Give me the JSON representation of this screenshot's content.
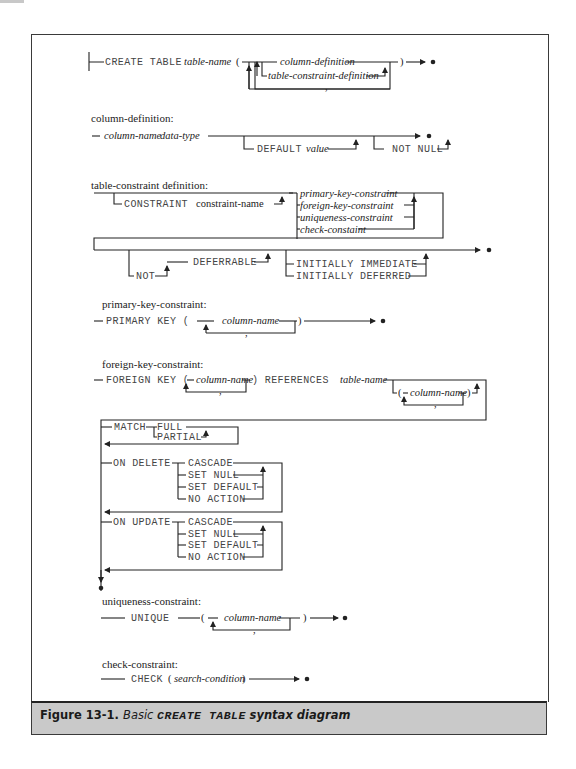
{
  "figure": {
    "label": "Figure 13-1.",
    "caption_prefix": "Basic",
    "caption_keyword": "CREATE TABLE",
    "caption_suffix": "syntax diagram"
  },
  "create_table": {
    "keyword": "CREATE TABLE",
    "table_name": "table-name",
    "open_paren": "(",
    "close_paren": ")",
    "column_definition": "column-definition",
    "table_constraint_definition": "table-constraint-definition",
    "separator": ","
  },
  "column_definition": {
    "heading": "column-definition:",
    "column_name": "column-name",
    "data_type": "data-type",
    "default_keyword": "DEFAULT",
    "default_value": "value",
    "not_null": "NOT NULL"
  },
  "table_constraint_definition": {
    "heading": "table-constraint definition:",
    "constraint_keyword": "CONSTRAINT",
    "constraint_name": "constraint-name",
    "options": [
      "primary-key-constraint",
      "foreign-key-constraint",
      "uniqueness-constraint",
      "check-constaint"
    ],
    "not": "NOT",
    "deferrable": "DEFERRABLE",
    "initially_immediate": "INITIALLY IMMEDIATE",
    "initially_deferred": "INITIALLY DEFERRED"
  },
  "primary_key_constraint": {
    "heading": "primary-key-constraint:",
    "keyword": "PRIMARY KEY (",
    "column_name": "column-name",
    "close_paren": ")",
    "separator": ","
  },
  "foreign_key_constraint": {
    "heading": "foreign-key-constraint:",
    "keyword": "FOREIGN KEY (",
    "column_name": "column-name",
    "references": ") REFERENCES",
    "table_name": "table-name",
    "ref_open": "(",
    "ref_column_name": "column-name",
    "ref_close": ")",
    "separator": ",",
    "match": "MATCH",
    "match_options": [
      "FULL",
      "PARTIAL"
    ],
    "on_delete": "ON DELETE",
    "on_update": "ON UPDATE",
    "actions": [
      "CASCADE",
      "SET NULL",
      "SET DEFAULT",
      "NO ACTION"
    ]
  },
  "uniqueness_constraint": {
    "heading": "uniqueness-constraint:",
    "keyword": "UNIQUE",
    "open_paren": "(",
    "column_name": "column-name",
    "close_paren": ")",
    "separator": ","
  },
  "check_constraint": {
    "heading": "check-constraint:",
    "keyword": "CHECK",
    "open_paren": "(",
    "search_condition": "search-condition",
    "close_paren": ")"
  }
}
